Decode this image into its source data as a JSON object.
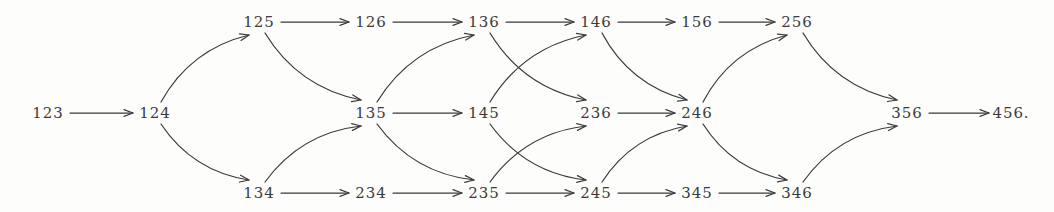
{
  "diagram": {
    "background_color": "#fdfdfc",
    "ink_color": "#3b3b3b",
    "width": 1054,
    "height": 212,
    "rows": {
      "top_y": 22,
      "middle_y": 113,
      "bottom_y": 193
    },
    "nodes": [
      {
        "id": "123",
        "label": "123",
        "x": 48,
        "y": 113,
        "row": "middle"
      },
      {
        "id": "124",
        "label": "124",
        "x": 155,
        "y": 113,
        "row": "middle"
      },
      {
        "id": "125",
        "label": "125",
        "x": 259,
        "y": 22,
        "row": "top"
      },
      {
        "id": "134",
        "label": "134",
        "x": 259,
        "y": 193,
        "row": "bottom"
      },
      {
        "id": "126",
        "label": "126",
        "x": 371,
        "y": 22,
        "row": "top"
      },
      {
        "id": "135",
        "label": "135",
        "x": 371,
        "y": 113,
        "row": "middle"
      },
      {
        "id": "234",
        "label": "234",
        "x": 371,
        "y": 193,
        "row": "bottom"
      },
      {
        "id": "136",
        "label": "136",
        "x": 484,
        "y": 22,
        "row": "top"
      },
      {
        "id": "145",
        "label": "145",
        "x": 484,
        "y": 113,
        "row": "middle"
      },
      {
        "id": "235",
        "label": "235",
        "x": 484,
        "y": 193,
        "row": "bottom"
      },
      {
        "id": "146",
        "label": "146",
        "x": 596,
        "y": 22,
        "row": "top"
      },
      {
        "id": "236",
        "label": "236",
        "x": 596,
        "y": 113,
        "row": "middle"
      },
      {
        "id": "245",
        "label": "245",
        "x": 596,
        "y": 193,
        "row": "bottom"
      },
      {
        "id": "156",
        "label": "156",
        "x": 697,
        "y": 22,
        "row": "top"
      },
      {
        "id": "246",
        "label": "246",
        "x": 697,
        "y": 113,
        "row": "middle"
      },
      {
        "id": "345",
        "label": "345",
        "x": 697,
        "y": 193,
        "row": "bottom"
      },
      {
        "id": "256",
        "label": "256",
        "x": 797,
        "y": 22,
        "row": "top"
      },
      {
        "id": "346",
        "label": "346",
        "x": 797,
        "y": 193,
        "row": "bottom"
      },
      {
        "id": "356",
        "label": "356",
        "x": 907,
        "y": 113,
        "row": "middle"
      },
      {
        "id": "456",
        "label": "456.",
        "x": 1011,
        "y": 113,
        "row": "middle"
      }
    ],
    "edges": [
      {
        "from": "123",
        "to": "124",
        "kind": "straight"
      },
      {
        "from": "124",
        "to": "125",
        "kind": "curve-up"
      },
      {
        "from": "124",
        "to": "134",
        "kind": "curve-down"
      },
      {
        "from": "125",
        "to": "126",
        "kind": "straight"
      },
      {
        "from": "125",
        "to": "135",
        "kind": "curve-down"
      },
      {
        "from": "134",
        "to": "234",
        "kind": "straight"
      },
      {
        "from": "134",
        "to": "135",
        "kind": "curve-up"
      },
      {
        "from": "126",
        "to": "136",
        "kind": "straight"
      },
      {
        "from": "135",
        "to": "136",
        "kind": "curve-up"
      },
      {
        "from": "135",
        "to": "145",
        "kind": "straight"
      },
      {
        "from": "135",
        "to": "235",
        "kind": "curve-down"
      },
      {
        "from": "234",
        "to": "235",
        "kind": "straight"
      },
      {
        "from": "136",
        "to": "146",
        "kind": "straight"
      },
      {
        "from": "136",
        "to": "236",
        "kind": "curve-down"
      },
      {
        "from": "145",
        "to": "146",
        "kind": "curve-up"
      },
      {
        "from": "145",
        "to": "245",
        "kind": "curve-down"
      },
      {
        "from": "235",
        "to": "236",
        "kind": "curve-up"
      },
      {
        "from": "235",
        "to": "245",
        "kind": "straight"
      },
      {
        "from": "146",
        "to": "156",
        "kind": "straight"
      },
      {
        "from": "146",
        "to": "246",
        "kind": "curve-down"
      },
      {
        "from": "236",
        "to": "246",
        "kind": "straight"
      },
      {
        "from": "245",
        "to": "345",
        "kind": "straight"
      },
      {
        "from": "245",
        "to": "246",
        "kind": "curve-up"
      },
      {
        "from": "156",
        "to": "256",
        "kind": "straight"
      },
      {
        "from": "246",
        "to": "256",
        "kind": "curve-up"
      },
      {
        "from": "246",
        "to": "346",
        "kind": "curve-down"
      },
      {
        "from": "345",
        "to": "346",
        "kind": "straight"
      },
      {
        "from": "256",
        "to": "356",
        "kind": "curve-down"
      },
      {
        "from": "346",
        "to": "356",
        "kind": "curve-up"
      },
      {
        "from": "356",
        "to": "456",
        "kind": "straight"
      }
    ]
  }
}
